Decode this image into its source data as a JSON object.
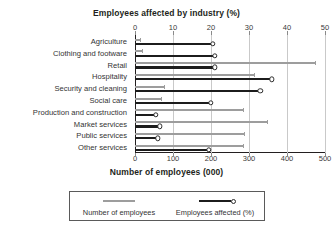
{
  "chart_data": {
    "type": "bar",
    "orientation": "horizontal",
    "title": "",
    "top_axis_title": "Employees affected by industry (%)",
    "bottom_axis_title": "Number of employees (000)",
    "ylabel": "",
    "grid": true,
    "legend_position": "bottom",
    "categories": [
      "Agriculture",
      "Clothing and footware",
      "Retail",
      "Hospitality",
      "Security and cleaning",
      "Social care",
      "Production and construction",
      "Market services",
      "Public services",
      "Other services"
    ],
    "series": [
      {
        "name": "Number of employees",
        "unit": "000",
        "axis": "bottom",
        "color": "#9d9d9d",
        "xlim": [
          0,
          500
        ],
        "ticks": [
          0,
          100,
          200,
          300,
          400,
          500
        ],
        "values": [
          15,
          20,
          475,
          315,
          80,
          72,
          288,
          350,
          290,
          288
        ]
      },
      {
        "name": "Employees affected (%)",
        "unit": "%",
        "axis": "top",
        "color": "#1c1c1c",
        "xlim": [
          0,
          50
        ],
        "ticks": [
          0,
          10,
          20,
          30,
          40,
          50
        ],
        "values": [
          20.5,
          21.0,
          21.0,
          36.0,
          33.0,
          20.0,
          5.5,
          6.5,
          6.0,
          19.5
        ]
      }
    ],
    "top_tick_labels": [
      "0",
      "10",
      "20",
      "30",
      "40",
      "50"
    ],
    "bottom_tick_labels": [
      "0",
      "100",
      "200",
      "300",
      "400",
      "500"
    ]
  },
  "legend": {
    "count_label": "Number of employees",
    "pct_label": "Employees affected (%)"
  }
}
